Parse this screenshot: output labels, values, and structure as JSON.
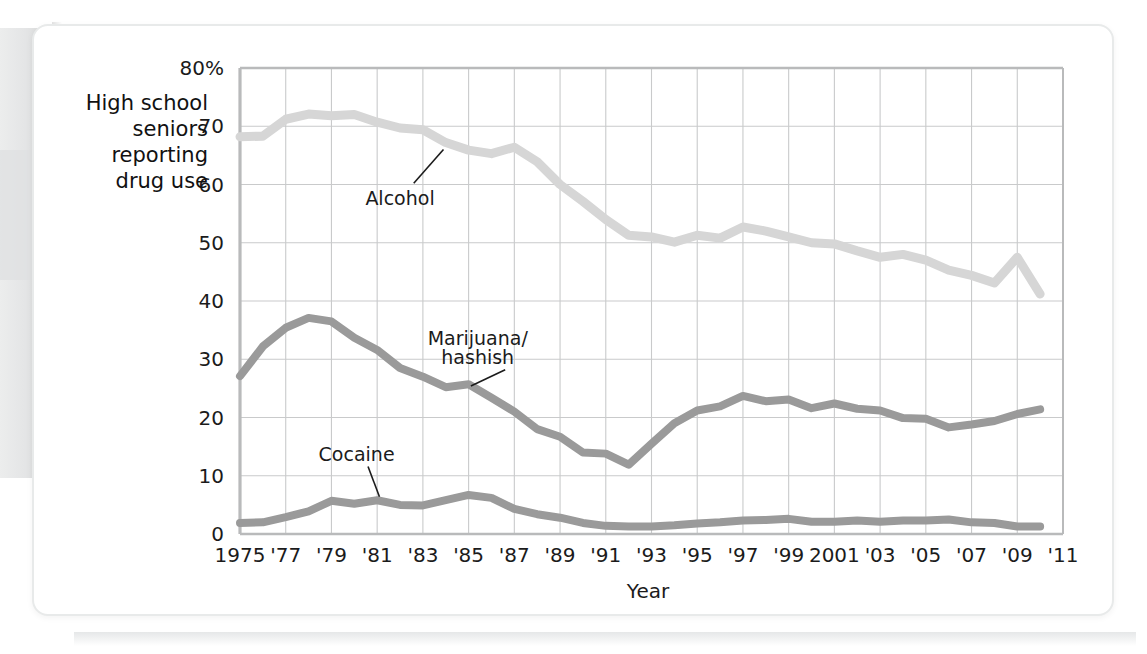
{
  "figure": {
    "y_caption_lines": [
      "High school",
      "seniors",
      "reporting",
      "drug use"
    ],
    "x_axis_title": "Year"
  },
  "chart_data": {
    "type": "line",
    "title": "",
    "xlabel": "Year",
    "ylabel": "High school seniors reporting drug use",
    "grid": true,
    "legend_position": "inline-annotations",
    "xlim": [
      1975,
      2011
    ],
    "ylim": [
      0,
      80
    ],
    "yticks": [
      0,
      10,
      20,
      30,
      40,
      50,
      60,
      70,
      80
    ],
    "ytick_labels": [
      "0",
      "10",
      "20",
      "30",
      "40",
      "50",
      "60",
      "70",
      "80%"
    ],
    "xticks": [
      1975,
      1977,
      1979,
      1981,
      1983,
      1985,
      1987,
      1989,
      1991,
      1993,
      1995,
      1997,
      1999,
      2001,
      2003,
      2005,
      2007,
      2009,
      2011
    ],
    "xtick_labels": [
      "1975",
      "'77",
      "'79",
      "'81",
      "'83",
      "'85",
      "'87",
      "'89",
      "'91",
      "'93",
      "'95",
      "'97",
      "'99",
      "2001",
      "'03",
      "'05",
      "'07",
      "'09",
      "'11"
    ],
    "x": [
      1975,
      1976,
      1977,
      1978,
      1979,
      1980,
      1981,
      1982,
      1983,
      1984,
      1985,
      1986,
      1987,
      1988,
      1989,
      1990,
      1991,
      1992,
      1993,
      1994,
      1995,
      1996,
      1997,
      1998,
      1999,
      2000,
      2001,
      2002,
      2003,
      2004,
      2005,
      2006,
      2007,
      2008,
      2009,
      2010
    ],
    "series": [
      {
        "name": "Alcohol",
        "color": "#d6d6d6",
        "label_anchor_x": 1984,
        "label_anchor_y": 66,
        "values": [
          68.2,
          68.3,
          71.2,
          72.1,
          71.8,
          72.0,
          70.7,
          69.7,
          69.4,
          67.2,
          65.9,
          65.3,
          66.4,
          63.9,
          60.0,
          57.1,
          54.0,
          51.3,
          51.0,
          50.1,
          51.3,
          50.8,
          52.7,
          52.0,
          51.0,
          50.0,
          49.8,
          48.6,
          47.5,
          48.0,
          47.0,
          45.3,
          44.4,
          43.1,
          47.5,
          41.2
        ]
      },
      {
        "name": "Marijuana/\nhashish",
        "color": "#9a9a9a",
        "label_anchor_x": 1988,
        "label_anchor_y": 22,
        "values": [
          27.1,
          32.2,
          35.4,
          37.1,
          36.5,
          33.7,
          31.6,
          28.5,
          27.0,
          25.2,
          25.7,
          23.4,
          21.0,
          18.0,
          16.7,
          14.0,
          13.8,
          11.9,
          15.5,
          19.0,
          21.2,
          21.9,
          23.7,
          22.8,
          23.1,
          21.6,
          22.4,
          21.5,
          21.2,
          19.9,
          19.8,
          18.3,
          18.8,
          19.4,
          20.6,
          21.4
        ]
      },
      {
        "name": "Cocaine",
        "color": "#9a9a9a",
        "label_anchor_x": 1981,
        "label_anchor_y": 5.5,
        "values": [
          1.9,
          2.0,
          2.9,
          3.9,
          5.7,
          5.2,
          5.8,
          5.0,
          4.9,
          5.8,
          6.7,
          6.2,
          4.3,
          3.4,
          2.8,
          1.9,
          1.4,
          1.3,
          1.3,
          1.5,
          1.8,
          2.0,
          2.3,
          2.4,
          2.6,
          2.1,
          2.1,
          2.3,
          2.1,
          2.3,
          2.3,
          2.5,
          2.0,
          1.9,
          1.3,
          1.3
        ]
      }
    ],
    "annotations": [
      {
        "text": "Alcohol",
        "x": 1982,
        "y": 57.5
      },
      {
        "text": "Marijuana/",
        "x": 1985.4,
        "y": 33.5
      },
      {
        "text": "hashish",
        "x": 1985.4,
        "y": 30.2
      },
      {
        "text": "Cocaine",
        "x": 1980.1,
        "y": 13.5
      }
    ]
  }
}
